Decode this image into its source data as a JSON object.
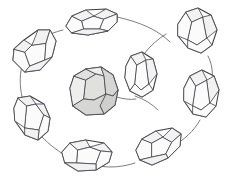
{
  "image": {
    "title": "Crystal cluster ring diagram",
    "description": "Line drawing of eight faceted crystal polyhedra arranged in a ring, connected by thin curved lines, with one larger shaded crystal at the center",
    "width": 228,
    "height": 184,
    "background_color": "#ffffff",
    "style": "hand-drawn line art"
  },
  "palette": {
    "background": "#ffffff",
    "outline_stroke": "#3c3c42",
    "facet_stroke": "#4a4a50",
    "link_stroke": "#6e6e72",
    "ring_crystal_fill": "#ffffff",
    "ring_crystal_facet_fill": "#f2f2f3",
    "center_crystal_fill": "#e3e3e1",
    "center_facet_light": "#eeeeec",
    "center_facet_mid": "#e0e0de",
    "center_facet_dark": "#cfcfcd"
  },
  "center_crystal": {
    "name": "center-crystal",
    "label": "Shaded faceted crystal",
    "shaded": true,
    "position": {
      "cx": 92,
      "cy": 92
    },
    "approx_size": {
      "width": 50,
      "height": 44
    },
    "facet_count": 7
  },
  "ring": {
    "name": "crystal-ring",
    "count": 8,
    "center": {
      "cx": 113,
      "cy": 92
    },
    "radius_x": 88,
    "radius_y": 72,
    "crystals": [
      {
        "id": "crystal-top",
        "label": "Top crystal",
        "angle_deg": 284,
        "position": {
          "cx": 89,
          "cy": 22
        },
        "rotation_deg": -14,
        "size": {
          "length": 46,
          "width": 22
        },
        "shaded": false
      },
      {
        "id": "crystal-top-right",
        "label": "Top-right crystal",
        "angle_deg": 330,
        "position": {
          "cx": 196,
          "cy": 32
        },
        "rotation_deg": 62,
        "size": {
          "length": 44,
          "width": 22
        },
        "shaded": false
      },
      {
        "id": "crystal-right",
        "label": "Right crystal",
        "angle_deg": 20,
        "position": {
          "cx": 200,
          "cy": 97
        },
        "rotation_deg": 78,
        "size": {
          "length": 42,
          "width": 21
        },
        "shaded": false
      },
      {
        "id": "crystal-bottom-right",
        "label": "Bottom-right crystal",
        "angle_deg": 62,
        "position": {
          "cx": 157,
          "cy": 150
        },
        "rotation_deg": 126,
        "size": {
          "length": 44,
          "width": 21
        },
        "shaded": false
      },
      {
        "id": "crystal-bottom",
        "label": "Bottom crystal",
        "angle_deg": 100,
        "position": {
          "cx": 85,
          "cy": 157
        },
        "rotation_deg": 168,
        "size": {
          "length": 46,
          "width": 21
        },
        "shaded": false
      },
      {
        "id": "crystal-bottom-left",
        "label": "Bottom-left crystal",
        "angle_deg": 145,
        "position": {
          "cx": 31,
          "cy": 119
        },
        "rotation_deg": 204,
        "size": {
          "length": 44,
          "width": 22
        },
        "shaded": false
      },
      {
        "id": "crystal-left",
        "label": "Left crystal",
        "angle_deg": 192,
        "position": {
          "cx": 31,
          "cy": 50
        },
        "rotation_deg": 242,
        "size": {
          "length": 46,
          "width": 22
        },
        "shaded": false
      },
      {
        "id": "crystal-inner-right",
        "label": "Inner right crystal",
        "angle_deg": 350,
        "position": {
          "cx": 141,
          "cy": 74
        },
        "rotation_deg": 96,
        "size": {
          "length": 42,
          "width": 21
        },
        "shaded": false
      }
    ]
  }
}
